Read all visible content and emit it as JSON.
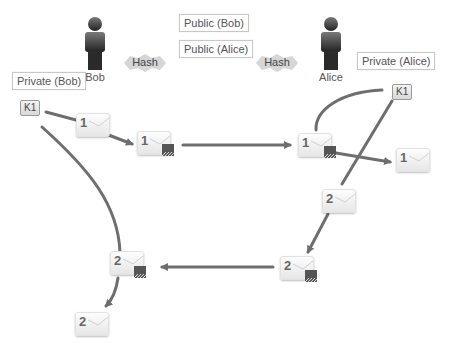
{
  "people": {
    "bob": {
      "name": "Bob"
    },
    "alice": {
      "name": "Alice"
    }
  },
  "public_keys": {
    "bob": "Public (Bob)",
    "alice": "Public (Alice)"
  },
  "private_keys": {
    "bob": "Private (Bob)",
    "alice": "Private (Alice)"
  },
  "key_badges": {
    "bob": "K1",
    "alice": "K1"
  },
  "hash_labels": {
    "left": "Hash",
    "right": "Hash"
  },
  "envelopes": [
    {
      "id": "m1-plain-bob",
      "number": "1",
      "locked": false
    },
    {
      "id": "m1-locked-bob",
      "number": "1",
      "locked": true
    },
    {
      "id": "m1-locked-alice",
      "number": "1",
      "locked": true
    },
    {
      "id": "m1-plain-alice",
      "number": "1",
      "locked": false
    },
    {
      "id": "m2-plain-alice",
      "number": "2",
      "locked": false
    },
    {
      "id": "m2-locked-alice",
      "number": "2",
      "locked": true
    },
    {
      "id": "m2-locked-bob",
      "number": "2",
      "locked": true
    },
    {
      "id": "m2-plain-bob",
      "number": "2",
      "locked": false
    }
  ],
  "colors": {
    "arrow": "#6e6e6e",
    "person_top": "#7a7a7a",
    "person_bottom": "#222222",
    "hash_bg": "#d6d6d6",
    "label_border": "#c8c8c8"
  }
}
